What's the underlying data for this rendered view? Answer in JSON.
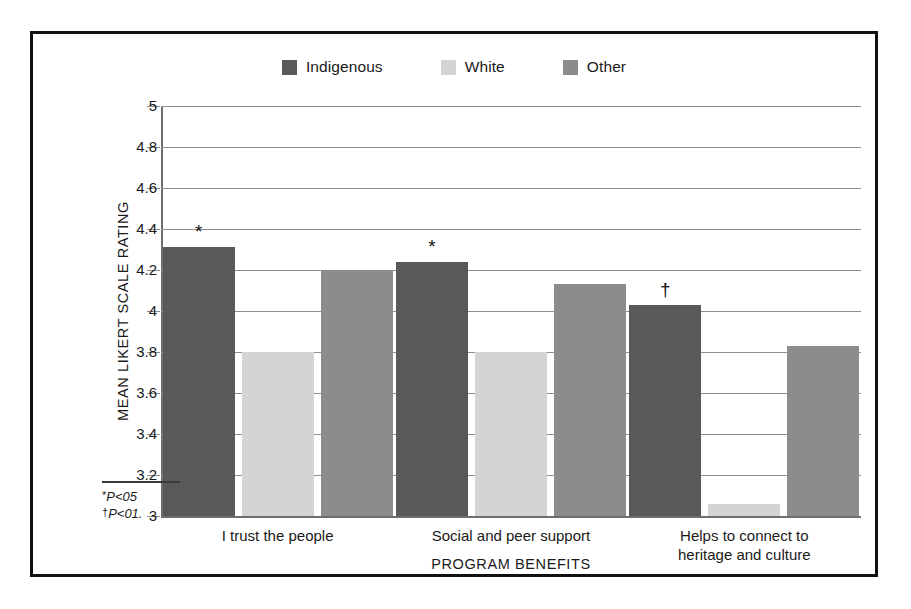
{
  "chart_data": {
    "type": "bar",
    "title": "",
    "subtitle": "",
    "xlabel": "PROGRAM BENEFITS",
    "ylabel": "MEAN LIKERT SCALE RATING",
    "categories": [
      "I trust the people",
      "Social and peer support",
      "Helps to connect to\nheritage and culture"
    ],
    "category_lines": [
      [
        "I trust the people"
      ],
      [
        "Social and peer support"
      ],
      [
        "Helps to connect to",
        "heritage and culture"
      ]
    ],
    "series": [
      {
        "name": "Indigenous",
        "color": "#595959",
        "values": [
          4.31,
          4.24,
          4.03
        ]
      },
      {
        "name": "White",
        "color": "#d4d4d4",
        "values": [
          3.8,
          3.8,
          3.06
        ]
      },
      {
        "name": "Other",
        "color": "#8c8c8c",
        "values": [
          4.2,
          4.13,
          3.83
        ]
      }
    ],
    "annotations": [
      {
        "text": "*",
        "series": "Indigenous",
        "category": "I trust the people"
      },
      {
        "text": "*",
        "series": "Indigenous",
        "category": "Social and peer support"
      },
      {
        "text": "†",
        "series": "Indigenous",
        "category": "Helps to connect to heritage and culture"
      }
    ],
    "ylim": [
      3,
      5
    ],
    "ytick_step": 0.2,
    "ytick_labels": [
      "5",
      "4.8",
      "4.6",
      "4.4",
      "4.2",
      "4",
      "3.8",
      "3.6",
      "3.4",
      "3.2",
      "3"
    ],
    "ytick_values": [
      5,
      4.8,
      4.6,
      4.4,
      4.2,
      4,
      3.8,
      3.6,
      3.4,
      3.2,
      3
    ],
    "grid": true,
    "legend_position": "top-center"
  },
  "legend": {
    "items": [
      {
        "label": "Indigenous",
        "color": "#595959"
      },
      {
        "label": "White",
        "color": "#d4d4d4"
      },
      {
        "label": "Other",
        "color": "#8c8c8c"
      }
    ]
  },
  "footnotes": [
    {
      "symbol": "*",
      "text": "P<05"
    },
    {
      "symbol": "†",
      "text": "P<01."
    }
  ],
  "colors": {
    "frame": "#111111",
    "gridline": "#8e8e8e",
    "axis": "#6f6f6f",
    "text": "#1a1a1a",
    "background": "#ffffff"
  }
}
